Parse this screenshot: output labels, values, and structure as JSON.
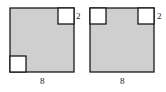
{
  "figures": [
    {
      "name": "figure-left",
      "outer": {
        "x": 10,
        "y": 8,
        "size": 64
      },
      "cutouts": [
        {
          "position": "top-right",
          "x": 58,
          "y": 8,
          "size": 16
        },
        {
          "position": "bottom-left",
          "x": 10,
          "y": 57,
          "size": 16
        }
      ],
      "side_label": "2",
      "side_label_pos": {
        "x": 77,
        "y": 19
      },
      "bottom_label": "8",
      "bottom_label_pos": {
        "x": 42,
        "y": 84
      }
    },
    {
      "name": "figure-right",
      "outer": {
        "x": 90,
        "y": 8,
        "size": 64
      },
      "cutouts": [
        {
          "position": "top-left",
          "x": 90,
          "y": 8,
          "size": 16
        },
        {
          "position": "top-right",
          "x": 138,
          "y": 8,
          "size": 16
        }
      ],
      "side_label": "2",
      "side_label_pos": {
        "x": 158,
        "y": 19
      },
      "bottom_label": "8",
      "bottom_label_pos": {
        "x": 122,
        "y": 84
      }
    }
  ],
  "colors": {
    "fill": "#cfcfcf",
    "stroke": "#1a1a1a",
    "cutout_fill": "#ffffff"
  }
}
